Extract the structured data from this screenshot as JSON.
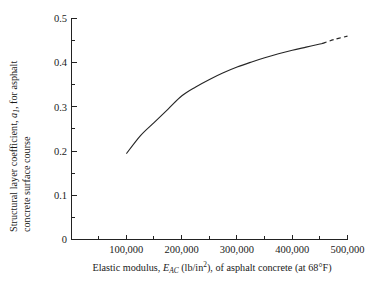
{
  "chart_data": {
    "type": "line",
    "title": "",
    "xlabel": "Elastic modulus, E_AC (lb/in^2), of asphalt concrete (at 68°F)",
    "ylabel": "Structural layer coefficient, a_1, for asphalt concrete surface course",
    "xlim": [
      0,
      500000
    ],
    "ylim": [
      0,
      0.5
    ],
    "grid": false,
    "legend": null,
    "x": [
      100000,
      125000,
      150000,
      175000,
      200000,
      225000,
      250000,
      275000,
      300000,
      325000,
      350000,
      375000,
      400000,
      425000,
      450000,
      455000,
      475000,
      500000
    ],
    "values": [
      0.195,
      0.235,
      0.265,
      0.295,
      0.325,
      0.345,
      0.362,
      0.377,
      0.39,
      0.401,
      0.411,
      0.42,
      0.428,
      0.435,
      0.442,
      0.4435,
      0.452,
      0.46
    ],
    "solid_segment_x": [
      100000,
      455000
    ],
    "dashed_segment_x": [
      455000,
      500000
    ],
    "series": [
      {
        "name": "a1 vs E_AC",
        "x": [
          100000,
          125000,
          150000,
          175000,
          200000,
          225000,
          250000,
          275000,
          300000,
          325000,
          350000,
          375000,
          400000,
          425000,
          450000,
          455000,
          475000,
          500000
        ],
        "values": [
          0.195,
          0.235,
          0.265,
          0.295,
          0.325,
          0.345,
          0.362,
          0.377,
          0.39,
          0.401,
          0.411,
          0.42,
          0.428,
          0.435,
          0.442,
          0.4435,
          0.452,
          0.46
        ],
        "style": "solid-then-dashed"
      }
    ],
    "y_ticks": [
      0,
      0.1,
      0.2,
      0.3,
      0.4,
      0.5
    ],
    "y_tick_labels": [
      "0",
      "0.1",
      "0.2",
      "0.3",
      "0.4",
      "0.5"
    ],
    "y_minor_ticks": [
      0.05,
      0.15,
      0.25,
      0.35,
      0.45
    ],
    "x_ticks": [
      100000,
      200000,
      300000,
      400000,
      500000
    ],
    "x_tick_labels": [
      "100,000",
      "200,000",
      "300,000",
      "400,000",
      "500,000"
    ],
    "x_minor_ticks": [
      50000,
      150000,
      250000,
      350000,
      450000
    ],
    "curve_color": "#262626",
    "axis_color": "#222222"
  },
  "axis_titles": {
    "y_line1_part1": "Structural layer coefficient, ",
    "y_line1_italic": "a",
    "y_line1_sub": "1",
    "y_line1_part2": ", for asphalt",
    "y_line2": "concrete surface course",
    "x_part1": "Elastic modulus, ",
    "x_italic": "E",
    "x_sub": "AC",
    "x_part2": " (lb/in",
    "x_sup": "2",
    "x_part3": "), of asphalt concrete (at 68°F)"
  }
}
